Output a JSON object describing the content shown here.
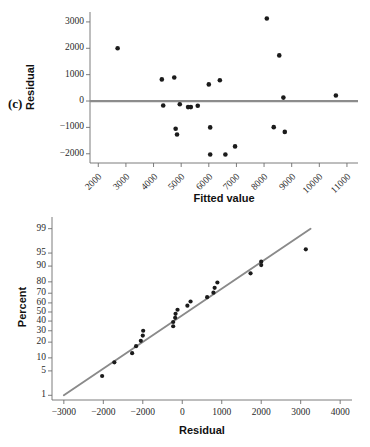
{
  "figure": {
    "panel_label": "(c)",
    "accent_line_color": "#8c8c8c",
    "point_color": "#1b1b1b",
    "axis_color": "#6e6e6e"
  },
  "chart_data": [
    {
      "type": "scatter",
      "name": "residuals-vs-fitted",
      "title": "",
      "xlabel": "Fitted value",
      "ylabel": "Residual",
      "xlim": [
        1700,
        11400
      ],
      "ylim": [
        -2350,
        3300
      ],
      "xticks": [
        2000,
        3000,
        4000,
        5000,
        6000,
        7000,
        8000,
        9000,
        10000,
        11000
      ],
      "xticklabels": [
        "2000",
        "3000",
        "4000",
        "5000",
        "6000",
        "7000",
        "8000",
        "9000",
        "10000",
        "11000"
      ],
      "yticks": [
        -2000,
        -1000,
        0,
        1000,
        2000,
        3000
      ],
      "yticklabels": [
        "-2000",
        "-1000",
        "0",
        "1000",
        "2000",
        "3000"
      ],
      "grid": false,
      "legend": "none",
      "reference_line": {
        "type": "horizontal",
        "y": 0,
        "color": "#8c8c8c"
      },
      "x": [
        2700,
        4300,
        4750,
        4950,
        5250,
        5600,
        6000,
        6050,
        6400,
        6600,
        6950,
        8100,
        8350,
        8550,
        8700,
        8750,
        10600,
        4350,
        4800,
        4850,
        5350,
        6050
      ],
      "y": [
        2000,
        820,
        890,
        -120,
        -230,
        -180,
        630,
        -1000,
        790,
        -2030,
        -1720,
        3130,
        -990,
        1730,
        130,
        -1170,
        210,
        -170,
        -1050,
        -1270,
        -230,
        -2030
      ]
    },
    {
      "type": "scatter",
      "name": "normal-probability-plot",
      "title": "",
      "xlabel": "Residual",
      "ylabel": "Percent",
      "xlim": [
        -3300,
        4300
      ],
      "ylim": [
        0.7,
        99.6
      ],
      "yscale": "probit",
      "xticks": [
        -3000,
        -2000,
        -1000,
        0,
        1000,
        2000,
        3000,
        4000
      ],
      "xticklabels": [
        "-3000",
        "-2000",
        "-2000",
        "0",
        "1000",
        "2000",
        "3000",
        "4000"
      ],
      "yticks": [
        1,
        5,
        10,
        20,
        30,
        40,
        50,
        60,
        70,
        80,
        90,
        95,
        99
      ],
      "yticklabels": [
        "1",
        "5",
        "10",
        "20",
        "30",
        "40",
        "50",
        "60",
        "70",
        "80",
        "90",
        "95",
        "99"
      ],
      "grid": false,
      "legend": "none",
      "fit_line": {
        "x": [
          -3000,
          3250
        ],
        "y": [
          1.0,
          99.0
        ],
        "color": "#8a8a8a"
      },
      "x": [
        -2030,
        -1720,
        -1270,
        -1170,
        -1050,
        -1000,
        -990,
        -230,
        -230,
        -180,
        -170,
        -120,
        130,
        210,
        630,
        790,
        820,
        890,
        1730,
        2000,
        2000,
        3130
      ],
      "y": [
        3.7,
        8.0,
        12.5,
        17.0,
        21.0,
        25.5,
        30.0,
        34.5,
        39.0,
        43.5,
        48.0,
        52.5,
        57.0,
        61.5,
        66.0,
        70.5,
        75.0,
        79.5,
        86.0,
        90.5,
        92.0,
        96.0
      ]
    }
  ]
}
